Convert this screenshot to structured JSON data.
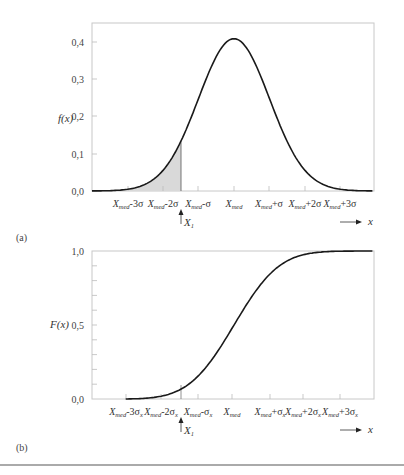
{
  "chart_data": [
    {
      "type": "area",
      "panel": "(a)",
      "title": "",
      "ylabel": "f(x)",
      "xlabel": "x",
      "yticks": [
        "0,0",
        "0,1",
        "0,2",
        "0,3",
        "0,4"
      ],
      "ylim": [
        0,
        0.44
      ],
      "xticks": [
        "X_med-3σ",
        "X_med-2σ",
        "X_med-σ",
        "X_med",
        "X_med+σ",
        "X_med+2σ",
        "X_med+3σ"
      ],
      "series": [
        {
          "name": "normal pdf",
          "x": [
            -4.5,
            -3,
            -2,
            -1.5,
            -1,
            -0.5,
            0,
            0.5,
            1,
            1.5,
            2,
            3,
            4.5
          ],
          "values": [
            0.0,
            0.004,
            0.054,
            0.13,
            0.242,
            0.352,
            0.399,
            0.352,
            0.242,
            0.13,
            0.054,
            0.004,
            0.0
          ]
        }
      ],
      "shaded_region": {
        "from": "-inf",
        "to": "X1",
        "x1_position": -1.7,
        "label": "X1"
      },
      "grid": false
    },
    {
      "type": "line",
      "panel": "(b)",
      "title": "",
      "ylabel": "F(x)",
      "xlabel": "x",
      "yticks": [
        "0,0",
        "0,5",
        "1,0"
      ],
      "ylim": [
        0,
        1.0
      ],
      "xticks": [
        "X_med-3σx",
        "X_med-2σx",
        "X_med-σx",
        "X_med",
        "X_med+σx",
        "X_med+2σx",
        "X_med+3σx"
      ],
      "series": [
        {
          "name": "normal cdf",
          "x": [
            -3,
            -2,
            -1.7,
            -1,
            0,
            1,
            2,
            3,
            4
          ],
          "values": [
            0.0,
            0.023,
            0.045,
            0.159,
            0.5,
            0.841,
            0.977,
            0.999,
            1.0
          ]
        }
      ],
      "marker": {
        "label": "X1",
        "x": -1.7
      },
      "grid": false
    }
  ],
  "top": {
    "panel_label": "(a)",
    "ylabel": "f(x)",
    "yticks": [
      {
        "label": "0,0",
        "y": 191
      },
      {
        "label": "0,1",
        "y": 154
      },
      {
        "label": "0,2",
        "y": 116
      },
      {
        "label": "0,3",
        "y": 79
      },
      {
        "label": "0,4",
        "y": 42
      }
    ],
    "xticks": [
      {
        "base": "X",
        "sub": "med",
        "suffix": "-3σ",
        "x": 128
      },
      {
        "base": "X",
        "sub": "med",
        "suffix": "-2σ",
        "x": 163
      },
      {
        "base": "X",
        "sub": "med",
        "suffix": "-σ",
        "x": 198
      },
      {
        "base": "X",
        "sub": "med",
        "suffix": "",
        "x": 234
      },
      {
        "base": "X",
        "sub": "med",
        "suffix": "+σ",
        "x": 269
      },
      {
        "base": "X",
        "sub": "med",
        "suffix": "+2σ",
        "x": 305
      },
      {
        "base": "X",
        "sub": "med",
        "suffix": "+3σ",
        "x": 340
      }
    ],
    "x1_label": "X",
    "x1_sub": "1",
    "x_arrow_label": "x"
  },
  "bottom": {
    "panel_label": "(b)",
    "ylabel": "F(x)",
    "yticks": [
      {
        "label": "0,0",
        "y": 399
      },
      {
        "label": "0,5",
        "y": 325
      },
      {
        "label": "1,0",
        "y": 251
      }
    ],
    "xticks": [
      {
        "base": "X",
        "sub": "med",
        "suffix": "-3σ",
        "suffix_sub": "x",
        "x": 126
      },
      {
        "base": "X",
        "sub": "med",
        "suffix": "-2σ",
        "suffix_sub": "x",
        "x": 161
      },
      {
        "base": "X",
        "sub": "med",
        "suffix": "-σ",
        "suffix_sub": "x",
        "x": 198
      },
      {
        "base": "X",
        "sub": "med",
        "suffix": "",
        "suffix_sub": "",
        "x": 232
      },
      {
        "base": "X",
        "sub": "med",
        "suffix": "+σ",
        "suffix_sub": "x",
        "x": 270
      },
      {
        "base": "X",
        "sub": "med",
        "suffix": "+2σ",
        "suffix_sub": "x",
        "x": 303
      },
      {
        "base": "X",
        "sub": "med",
        "suffix": "+3σ",
        "suffix_sub": "x",
        "x": 340
      }
    ],
    "x1_label": "X",
    "x1_sub": "1",
    "x_arrow_label": "x"
  },
  "colors": {
    "curve": "#1a1a1a",
    "frame": "#c8c8c8",
    "shade": "#d9d9d9"
  }
}
